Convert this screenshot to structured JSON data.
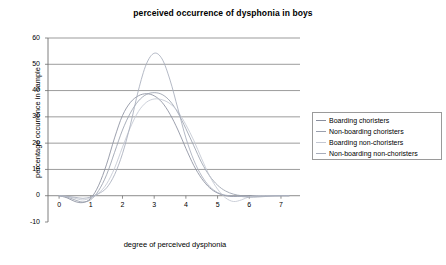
{
  "chart_data": {
    "type": "line",
    "title": "perceived occurrence of dysphonia in boys",
    "xlabel": "degree of perceived dysphonia",
    "ylabel": "percentage occurrence in sample",
    "xlim": [
      -0.35,
      7.6
    ],
    "ylim": [
      -10,
      60
    ],
    "xticks": [
      "0",
      "1",
      "2",
      "3",
      "4",
      "5",
      "6",
      "7"
    ],
    "yticks": [
      "-10",
      "0",
      "10",
      "20",
      "30",
      "40",
      "50",
      "60"
    ],
    "grid": "horizontal",
    "legend_position": "right",
    "x": [
      0,
      0.25,
      0.5,
      0.75,
      1,
      1.25,
      1.5,
      1.75,
      2,
      2.25,
      2.5,
      2.75,
      3,
      3.25,
      3.5,
      3.75,
      4,
      4.25,
      4.5,
      4.75,
      5,
      5.25,
      5.5,
      5.75,
      6,
      6.25,
      6.5,
      6.75,
      7,
      7.25
    ],
    "series": [
      {
        "name": "Boarding choristers",
        "color": "#8a8f9e",
        "values": [
          0,
          -0.8,
          -2.2,
          -2.6,
          -1.0,
          4.0,
          12.0,
          22.0,
          30.5,
          35.5,
          38.0,
          38.8,
          38.0,
          35.5,
          31.0,
          25.0,
          18.0,
          11.5,
          6.5,
          3.0,
          1.0,
          0.0,
          -0.3,
          -0.2,
          0.0,
          0.0,
          0.0,
          0.0,
          0.0,
          0.0
        ]
      },
      {
        "name": "Non-boarding choristers",
        "color": "#9aa0ae",
        "values": [
          0,
          -0.5,
          -1.6,
          -2.4,
          -1.5,
          2.0,
          8.0,
          16.5,
          25.0,
          31.5,
          36.0,
          38.5,
          39.2,
          38.5,
          36.0,
          31.5,
          25.5,
          19.0,
          12.5,
          7.5,
          4.0,
          1.8,
          0.6,
          0.0,
          -0.2,
          -0.2,
          -0.1,
          0.0,
          0.0,
          0.0
        ]
      },
      {
        "name": "Boarding non-choristers",
        "color": "#c3c7d2",
        "values": [
          0,
          -0.3,
          -1.0,
          -1.6,
          -0.8,
          1.0,
          4.5,
          10.5,
          18.5,
          26.0,
          32.0,
          35.5,
          36.8,
          36.5,
          35.0,
          32.0,
          27.0,
          21.0,
          14.0,
          7.5,
          2.5,
          -0.8,
          -2.2,
          -1.6,
          -0.4,
          0.0,
          0.0,
          0.0,
          0.0,
          0.0
        ]
      },
      {
        "name": "Non-boarding non-choristers",
        "color": "#a7acba",
        "values": [
          0,
          -0.2,
          -0.6,
          -1.0,
          -0.5,
          0.8,
          3.0,
          8.0,
          16.0,
          27.0,
          40.0,
          50.0,
          54.2,
          52.0,
          44.0,
          33.0,
          22.0,
          13.5,
          7.5,
          3.5,
          1.2,
          0.2,
          -0.1,
          -0.3,
          -0.6,
          -0.5,
          -0.3,
          -0.1,
          0.0,
          0.0
        ]
      }
    ]
  },
  "legend": {
    "items": [
      {
        "label": "Boarding choristers"
      },
      {
        "label": "Non-boarding choristers"
      },
      {
        "label": "Boarding non-choristers"
      },
      {
        "label": "Non-boarding non-choristers"
      }
    ]
  },
  "colors": {
    "grid": "#707070",
    "axis": "#707070",
    "legend_border": "#9a9a9a",
    "text": "#000000"
  }
}
